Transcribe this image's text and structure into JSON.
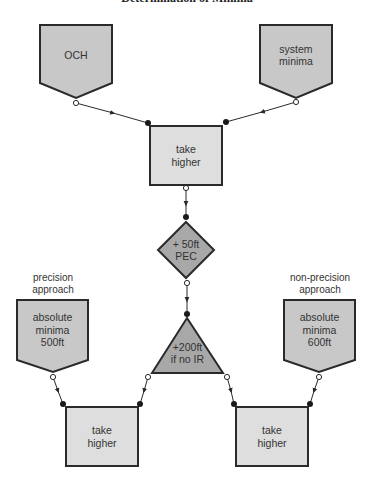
{
  "title": "Determination of Minima",
  "colors": {
    "stroke": "#2a2a2a",
    "input_fill": "#c8c8c8",
    "operator_fill": "#a8a8a8",
    "box_fill": "#dedede",
    "text": "#333333"
  },
  "nodes": {
    "och": {
      "line1": "OCH",
      "line2": ""
    },
    "system_minima": {
      "line1": "system",
      "line2": "minima"
    },
    "take_higher_top": {
      "line1": "take",
      "line2": "higher"
    },
    "pec": {
      "line1": "+ 50ft",
      "line2": "PEC"
    },
    "no_ir": {
      "line1": "+200ft",
      "line2": "if no IR"
    },
    "abs_min_precision": {
      "line1": "absolute",
      "line2": "minima",
      "line3": "500ft"
    },
    "abs_min_nonprecision": {
      "line1": "absolute",
      "line2": "minima",
      "line3": "600ft"
    },
    "take_higher_left": {
      "line1": "take",
      "line2": "higher"
    },
    "take_higher_right": {
      "line1": "take",
      "line2": "higher"
    }
  },
  "labels": {
    "precision": {
      "line1": "precision",
      "line2": "approach"
    },
    "non_precision": {
      "line1": "non-precision",
      "line2": "approach"
    }
  }
}
